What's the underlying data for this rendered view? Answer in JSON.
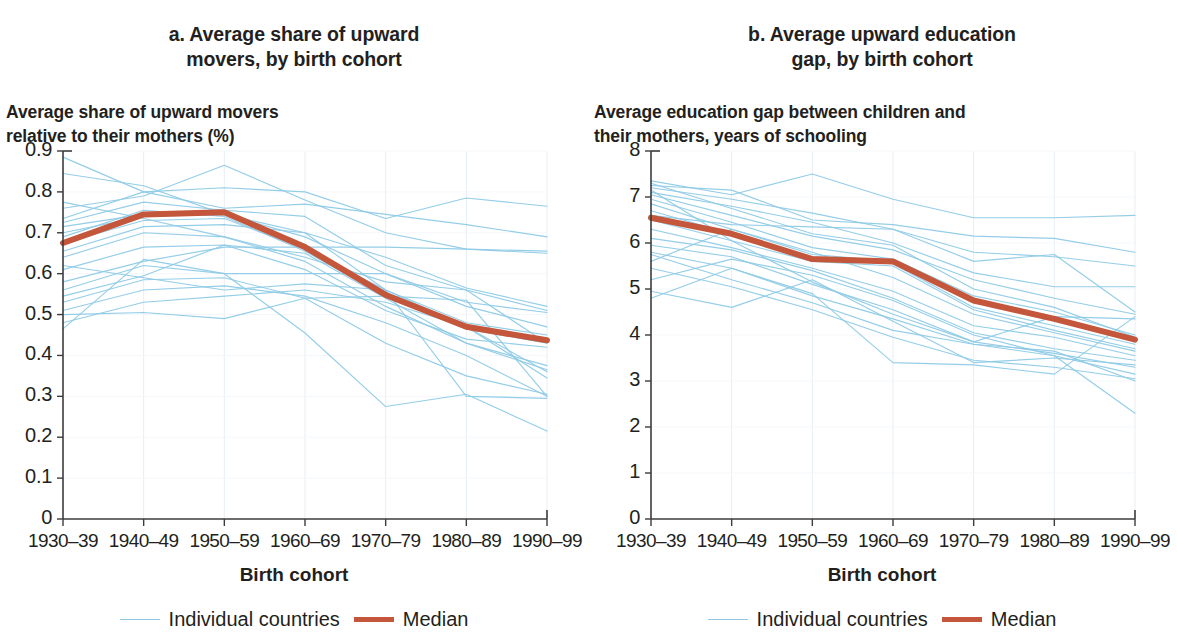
{
  "panels": [
    {
      "id": "a",
      "title_line1": "a. Average share of upward",
      "title_line2": "movers, by birth cohort",
      "axis_note_line1": "Average share of upward movers",
      "axis_note_line2": "relative to their mothers (%)",
      "xaxis_caption": "Birth cohort",
      "legend": {
        "series_label": "Individual countries",
        "median_label": "Median"
      }
    },
    {
      "id": "b",
      "title_line1": "b. Average upward education",
      "title_line2": "gap, by birth cohort",
      "axis_note_line1": "Average education gap between children and",
      "axis_note_line2": "their mothers, years of schooling",
      "xaxis_caption": "Birth cohort",
      "legend": {
        "series_label": "Individual countries",
        "median_label": "Median"
      }
    }
  ],
  "colors": {
    "individual": "#8ecae6",
    "median": "#c4563c",
    "axis": "#3c3c3c",
    "grid": "#e9eef3",
    "text": "#231f20"
  },
  "chart_data": [
    {
      "type": "line",
      "panel": "a",
      "title": "a. Average share of upward movers, by birth cohort",
      "xlabel": "Birth cohort",
      "ylabel": "Average share of upward movers relative to their mothers (%)",
      "categories": [
        "1930–39",
        "1940–49",
        "1950–59",
        "1960–69",
        "1970–79",
        "1980–89",
        "1990–99"
      ],
      "ylim": [
        0,
        0.9
      ],
      "yticks": [
        "0",
        "0.1",
        "0.2",
        "0.3",
        "0.4",
        "0.5",
        "0.6",
        "0.7",
        "0.8",
        "0.9"
      ],
      "ytick_values": [
        0,
        0.1,
        0.2,
        0.3,
        0.4,
        0.5,
        0.6,
        0.7,
        0.8,
        0.9
      ],
      "grid": true,
      "legend_position": "bottom",
      "median_series": {
        "name": "Median",
        "values": [
          0.675,
          0.745,
          0.75,
          0.665,
          0.548,
          0.47,
          0.437
        ]
      },
      "series": [
        {
          "name": "country-01",
          "values": [
            0.885,
            0.8,
            0.81,
            0.8,
            0.735,
            0.785,
            0.765
          ]
        },
        {
          "name": "country-02",
          "values": [
            0.76,
            0.79,
            0.865,
            0.78,
            0.7,
            0.66,
            0.655
          ]
        },
        {
          "name": "country-03",
          "values": [
            0.735,
            0.8,
            0.76,
            0.77,
            0.745,
            0.72,
            0.69
          ]
        },
        {
          "name": "country-04",
          "values": [
            0.725,
            0.775,
            0.755,
            0.74,
            0.62,
            0.56,
            0.51
          ]
        },
        {
          "name": "country-05",
          "values": [
            0.715,
            0.745,
            0.75,
            0.66,
            0.56,
            0.48,
            0.45
          ]
        },
        {
          "name": "country-06",
          "values": [
            0.7,
            0.74,
            0.745,
            0.69,
            0.6,
            0.52,
            0.47
          ]
        },
        {
          "name": "country-07",
          "values": [
            0.69,
            0.755,
            0.74,
            0.655,
            0.545,
            0.465,
            0.43
          ]
        },
        {
          "name": "country-08",
          "values": [
            0.675,
            0.73,
            0.735,
            0.66,
            0.555,
            0.47,
            0.44
          ]
        },
        {
          "name": "country-09",
          "values": [
            0.655,
            0.715,
            0.72,
            0.7,
            0.64,
            0.565,
            0.52
          ]
        },
        {
          "name": "country-10",
          "values": [
            0.64,
            0.7,
            0.69,
            0.63,
            0.52,
            0.43,
            0.375
          ]
        },
        {
          "name": "country-11",
          "values": [
            0.61,
            0.665,
            0.67,
            0.61,
            0.51,
            0.44,
            0.42
          ]
        },
        {
          "name": "country-12",
          "values": [
            0.58,
            0.63,
            0.665,
            0.665,
            0.665,
            0.66,
            0.65
          ]
        },
        {
          "name": "country-13",
          "values": [
            0.56,
            0.62,
            0.6,
            0.6,
            0.6,
            0.53,
            0.505
          ]
        },
        {
          "name": "country-14",
          "values": [
            0.545,
            0.595,
            0.67,
            0.65,
            0.54,
            0.43,
            0.365
          ]
        },
        {
          "name": "country-15",
          "values": [
            0.53,
            0.585,
            0.59,
            0.54,
            0.43,
            0.35,
            0.305
          ]
        },
        {
          "name": "country-16",
          "values": [
            0.51,
            0.56,
            0.57,
            0.545,
            0.48,
            0.4,
            0.3
          ]
        },
        {
          "name": "country-17",
          "values": [
            0.5,
            0.505,
            0.49,
            0.54,
            0.545,
            0.535,
            0.3
          ]
        },
        {
          "name": "country-18",
          "values": [
            0.48,
            0.53,
            0.545,
            0.56,
            0.53,
            0.47,
            0.345
          ]
        },
        {
          "name": "country-19",
          "values": [
            0.465,
            0.635,
            0.6,
            0.455,
            0.275,
            0.305,
            0.215
          ]
        },
        {
          "name": "country-20",
          "values": [
            0.775,
            0.735,
            0.69,
            0.64,
            0.58,
            0.56,
            0.43
          ]
        },
        {
          "name": "country-21",
          "values": [
            0.845,
            0.815,
            0.745,
            0.7,
            0.56,
            0.47,
            0.36
          ]
        },
        {
          "name": "country-22",
          "values": [
            0.62,
            0.59,
            0.56,
            0.575,
            0.56,
            0.3,
            0.295
          ]
        }
      ]
    },
    {
      "type": "line",
      "panel": "b",
      "title": "b. Average upward education gap, by birth cohort",
      "xlabel": "Birth cohort",
      "ylabel": "Average education gap between children and their mothers, years of schooling",
      "categories": [
        "1930–39",
        "1940–49",
        "1950–59",
        "1960–69",
        "1970–79",
        "1980–89",
        "1990–99"
      ],
      "ylim": [
        0,
        8
      ],
      "yticks": [
        "0",
        "1",
        "2",
        "3",
        "4",
        "5",
        "6",
        "7",
        "8"
      ],
      "ytick_values": [
        0,
        1,
        2,
        3,
        4,
        5,
        6,
        7,
        8
      ],
      "grid": true,
      "legend_position": "bottom",
      "median_series": {
        "name": "Median",
        "values": [
          6.55,
          6.2,
          5.65,
          5.6,
          4.75,
          4.35,
          3.9
        ]
      },
      "series": [
        {
          "name": "country-01",
          "values": [
            7.35,
            7.05,
            7.5,
            6.95,
            6.55,
            6.55,
            6.6
          ]
        },
        {
          "name": "country-02",
          "values": [
            7.25,
            7.15,
            6.5,
            6.4,
            6.15,
            6.1,
            5.8
          ]
        },
        {
          "name": "country-03",
          "values": [
            7.2,
            6.95,
            6.65,
            6.3,
            5.8,
            5.7,
            5.5
          ]
        },
        {
          "name": "country-04",
          "values": [
            7.1,
            6.8,
            6.45,
            6.0,
            5.35,
            5.05,
            5.05
          ]
        },
        {
          "name": "country-05",
          "values": [
            7.05,
            6.6,
            6.15,
            5.85,
            5.2,
            4.8,
            4.45
          ]
        },
        {
          "name": "country-06",
          "values": [
            6.95,
            6.45,
            5.9,
            5.65,
            4.85,
            4.5,
            4.0
          ]
        },
        {
          "name": "country-07",
          "values": [
            6.85,
            6.3,
            5.75,
            5.6,
            4.7,
            4.35,
            3.9
          ]
        },
        {
          "name": "country-08",
          "values": [
            6.7,
            6.2,
            5.7,
            5.55,
            4.6,
            4.2,
            3.8
          ]
        },
        {
          "name": "country-09",
          "values": [
            6.5,
            6.05,
            5.6,
            5.5,
            4.55,
            4.1,
            3.7
          ]
        },
        {
          "name": "country-10",
          "values": [
            6.3,
            5.9,
            5.45,
            4.95,
            4.2,
            3.95,
            3.55
          ]
        },
        {
          "name": "country-11",
          "values": [
            6.1,
            5.85,
            5.4,
            4.8,
            4.05,
            3.7,
            3.45
          ]
        },
        {
          "name": "country-12",
          "values": [
            5.95,
            5.7,
            5.1,
            4.55,
            3.85,
            3.6,
            3.3
          ]
        },
        {
          "name": "country-13",
          "values": [
            5.8,
            5.45,
            4.85,
            4.35,
            3.8,
            3.55,
            3.15
          ]
        },
        {
          "name": "country-14",
          "values": [
            5.75,
            5.2,
            4.7,
            4.1,
            3.8,
            3.65,
            3.0
          ]
        },
        {
          "name": "country-15",
          "values": [
            5.6,
            6.3,
            5.8,
            5.25,
            4.45,
            4.05,
            3.65
          ]
        },
        {
          "name": "country-16",
          "values": [
            5.45,
            5.05,
            4.55,
            3.95,
            3.45,
            3.3,
            3.05
          ]
        },
        {
          "name": "country-17",
          "values": [
            5.2,
            5.65,
            5.3,
            4.75,
            4.0,
            3.55,
            2.3
          ]
        },
        {
          "name": "country-18",
          "values": [
            4.95,
            4.6,
            5.2,
            4.3,
            3.4,
            3.5,
            3.35
          ]
        },
        {
          "name": "country-19",
          "values": [
            4.8,
            5.45,
            4.9,
            3.4,
            3.35,
            3.15,
            4.4
          ]
        },
        {
          "name": "country-20",
          "values": [
            7.15,
            6.05,
            5.15,
            4.45,
            3.85,
            4.4,
            4.35
          ]
        },
        {
          "name": "country-21",
          "values": [
            6.6,
            6.4,
            6.35,
            6.3,
            5.6,
            5.75,
            4.5
          ]
        },
        {
          "name": "country-22",
          "values": [
            7.3,
            6.75,
            6.2,
            5.95,
            5.0,
            4.6,
            3.95
          ]
        }
      ]
    }
  ]
}
